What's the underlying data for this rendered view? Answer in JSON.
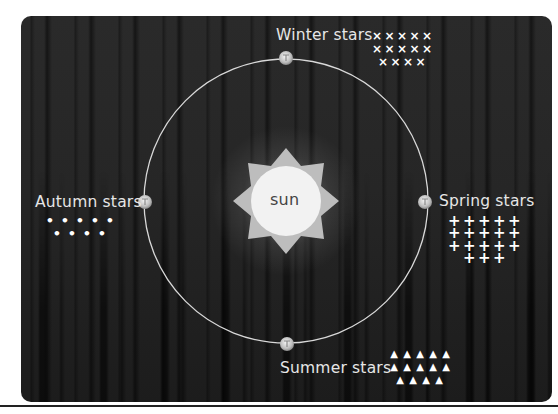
{
  "diagram": {
    "center_label": "sun",
    "colors": {
      "background": "#262626",
      "orbit": "#d9d9d9",
      "sun_core": "#f2f2f2",
      "sun_rays": "#bdbdbd",
      "text": "#e6e6e6",
      "symbols": "#ffffff"
    },
    "positions": [
      {
        "id": "winter",
        "label": "Winter stars",
        "symbol": "cross-x",
        "glyph": "×",
        "rows": [
          5,
          5,
          4
        ]
      },
      {
        "id": "autumn",
        "label": "Autumn stars",
        "symbol": "dot",
        "glyph": "•",
        "rows": [
          5,
          4
        ]
      },
      {
        "id": "spring",
        "label": "Spring stars",
        "symbol": "plus",
        "glyph": "+",
        "rows": [
          5,
          5,
          5,
          3
        ]
      },
      {
        "id": "summer",
        "label": "Summer stars",
        "symbol": "triangle",
        "glyph": "▲",
        "rows": [
          5,
          5,
          4
        ]
      }
    ]
  }
}
